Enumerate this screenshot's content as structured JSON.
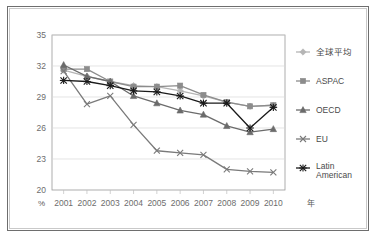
{
  "chart_data": {
    "type": "line",
    "title": "",
    "xlabel": "年",
    "ylabel": "%",
    "x": [
      "2001",
      "2002",
      "2003",
      "2004",
      "2005",
      "2006",
      "2007",
      "2008",
      "2009",
      "2010"
    ],
    "categories": [
      "2001",
      "2002",
      "2003",
      "2004",
      "2005",
      "2006",
      "2007",
      "2008",
      "2009",
      "2010"
    ],
    "ylim": [
      20,
      35
    ],
    "yticks": [
      20,
      23,
      26,
      29,
      32,
      35
    ],
    "ytick_labels": [
      "20",
      "23",
      "26",
      "29",
      "32",
      "35"
    ],
    "grid": true,
    "legend_position": "right",
    "series": [
      {
        "name": "全球平均",
        "marker": "diamond",
        "color": "#b5b5b5",
        "values": [
          31.6,
          31.0,
          30.5,
          30.1,
          30.0,
          29.6,
          29.1,
          28.5,
          28.1,
          28.2
        ]
      },
      {
        "name": "ASPAC",
        "marker": "square",
        "color": "#8c8c8c",
        "values": [
          31.7,
          31.7,
          30.5,
          30.0,
          30.0,
          30.1,
          29.2,
          28.5,
          28.1,
          28.2
        ]
      },
      {
        "name": "OECD",
        "marker": "triangle",
        "color": "#6b6b6b",
        "values": [
          32.1,
          31.0,
          30.5,
          29.1,
          28.4,
          27.7,
          27.3,
          26.2,
          25.6,
          25.9
        ]
      },
      {
        "name": "EU",
        "marker": "cross",
        "color": "#7a7a7a",
        "values": [
          31.5,
          28.3,
          29.1,
          26.3,
          23.8,
          23.6,
          23.4,
          22.0,
          21.8,
          21.7
        ]
      },
      {
        "name": "Latin American",
        "marker": "star",
        "color": "#1a1a1a",
        "values": [
          30.6,
          30.5,
          30.1,
          29.6,
          29.5,
          29.1,
          28.4,
          28.4,
          26.0,
          28.0
        ]
      }
    ]
  },
  "axis": {
    "y_unit_label": "%",
    "x_unit_label": "年"
  },
  "legend": {
    "items": [
      {
        "label": "全球平均",
        "label2": ""
      },
      {
        "label": "ASPAC",
        "label2": ""
      },
      {
        "label": "OECD",
        "label2": ""
      },
      {
        "label": "EU",
        "label2": ""
      },
      {
        "label": "Latin",
        "label2": "American"
      }
    ]
  }
}
